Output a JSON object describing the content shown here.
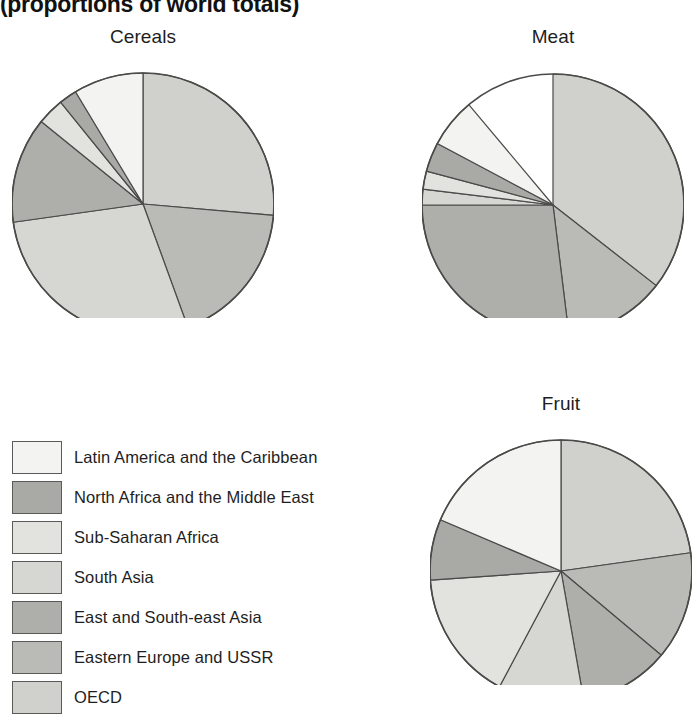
{
  "figure": {
    "subtitle": "(proportions of world totals)"
  },
  "legend": {
    "items": [
      {
        "label": "Latin America and the Caribbean",
        "color": "#f3f3f1",
        "key": "latin-america"
      },
      {
        "label": "North Africa and the Middle East",
        "color": "#a9a9a6",
        "key": "north-africa"
      },
      {
        "label": "Sub-Saharan Africa",
        "color": "#e2e2df",
        "key": "sub-saharan-africa"
      },
      {
        "label": "South Asia",
        "color": "#d6d6d2",
        "key": "south-asia"
      },
      {
        "label": "East and South-east Asia",
        "color": "#aeaeab",
        "key": "east-southeast-asia"
      },
      {
        "label": "Eastern Europe and USSR",
        "color": "#babab7",
        "key": "eastern-europe-ussr"
      },
      {
        "label": "OECD",
        "color": "#d0d0cc",
        "key": "oecd"
      }
    ]
  },
  "chart_data": [
    {
      "type": "pie",
      "title": "Cereals",
      "center": [
        131,
        152
      ],
      "radius": 131,
      "start_angle": 0,
      "direction": "clockwise",
      "categories": [
        "OECD",
        "Eastern Europe and USSR",
        "South Asia",
        "East and South-east Asia",
        "Sub-Saharan Africa",
        "North Africa and the Middle East",
        "Latin America and the Caribbean"
      ],
      "values": [
        26.4,
        18.1,
        28.3,
        13.1,
        3.3,
        2.2,
        8.6
      ],
      "colors": [
        "#d0d0cc",
        "#babab7",
        "#d6d6d2",
        "#aeaeab",
        "#e2e2df",
        "#a9a9a6",
        "#f3f3f1"
      ],
      "angles": [
        95,
        65,
        102,
        47,
        12,
        8,
        31
      ],
      "units": "percent of world total"
    },
    {
      "type": "pie",
      "title": "Meat",
      "center": [
        131,
        153
      ],
      "radius": 131,
      "start_angle": 0,
      "direction": "clockwise",
      "categories": [
        "OECD",
        "Eastern Europe and USSR",
        "East and South-east Asia",
        "South Asia",
        "Sub-Saharan Africa",
        "North Africa and the Middle East",
        "Latin America and the Caribbean"
      ],
      "values": [
        35.6,
        12.5,
        26.9,
        1.9,
        2.2,
        3.6,
        6.1
      ],
      "colors": [
        "#d0d0cc",
        "#babab7",
        "#aeaeab",
        "#d6d6d2",
        "#e2e2df",
        "#a9a9a6",
        "#f3f3f1"
      ],
      "angles": [
        128,
        45,
        97,
        7,
        8,
        13,
        22
      ],
      "units": "percent of world total"
    },
    {
      "type": "pie",
      "title": "Fruit",
      "center": [
        131,
        152
      ],
      "radius": 131,
      "start_angle": 0,
      "direction": "clockwise",
      "categories": [
        "OECD",
        "Eastern Europe and USSR",
        "East and South-east Asia",
        "South Asia",
        "Sub-Saharan Africa",
        "North Africa and the Middle East",
        "Latin America and the Caribbean"
      ],
      "values": [
        22.8,
        13.3,
        11.1,
        10.6,
        16.1,
        7.5,
        18.6
      ],
      "colors": [
        "#d0d0cc",
        "#babab7",
        "#aeaeab",
        "#d6d6d2",
        "#e2e2df",
        "#a9a9a6",
        "#f3f3f1"
      ],
      "angles": [
        82,
        48,
        40,
        38,
        58,
        27,
        67
      ],
      "units": "percent of world total"
    }
  ]
}
